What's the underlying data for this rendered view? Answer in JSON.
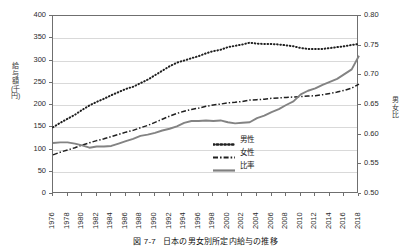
{
  "caption": {
    "number": "図 7-7",
    "text": "日本の男女別所定内給与の推移"
  },
  "axes": {
    "left_title": "給与額(千円)",
    "right_title": "男女比",
    "left_ticks": [
      "400",
      "350",
      "300",
      "250",
      "200",
      "150",
      "100",
      "50",
      "0"
    ],
    "right_ticks": [
      "0.80",
      "0.75",
      "0.70",
      "0.65",
      "0.60",
      "0.55",
      "0.50"
    ],
    "x_ticks": [
      "1976",
      "1978",
      "1980",
      "1982",
      "1984",
      "1986",
      "1988",
      "1990",
      "1992",
      "1994",
      "1996",
      "1998",
      "2000",
      "2002",
      "2004",
      "2006",
      "2008",
      "2010",
      "2012",
      "2014",
      "2016",
      "2018"
    ]
  },
  "legend": {
    "items": [
      {
        "label": "男性",
        "style": "dotted",
        "color": "#1f1f1f"
      },
      {
        "label": "女性",
        "style": "dashdot",
        "color": "#1f1f1f"
      },
      {
        "label": "比率",
        "style": "solid",
        "color": "#808080"
      }
    ]
  },
  "chart_data": {
    "type": "line",
    "title": "日本の男女別所定内給与の推移",
    "xlabel": "",
    "ylabel": "給与額(千円)",
    "y2label": "男女比",
    "ylim": [
      0,
      400
    ],
    "y2lim": [
      0.5,
      0.8
    ],
    "xlim": [
      1976,
      2018
    ],
    "grid": true,
    "legend_position": "center",
    "x": [
      1976,
      1977,
      1978,
      1979,
      1980,
      1981,
      1982,
      1983,
      1984,
      1985,
      1986,
      1987,
      1988,
      1989,
      1990,
      1991,
      1992,
      1993,
      1994,
      1995,
      1996,
      1997,
      1998,
      1999,
      2000,
      2001,
      2002,
      2003,
      2004,
      2005,
      2006,
      2007,
      2008,
      2009,
      2010,
      2011,
      2012,
      2013,
      2014,
      2015,
      2016,
      2017,
      2018
    ],
    "series": [
      {
        "name": "男性",
        "axis": "left",
        "unit": "千円",
        "values": [
          150,
          160,
          169,
          178,
          189,
          199,
          207,
          214,
          222,
          229,
          236,
          241,
          249,
          257,
          267,
          277,
          287,
          295,
          300,
          305,
          310,
          316,
          321,
          324,
          330,
          333,
          336,
          340,
          338,
          337,
          337,
          336,
          334,
          332,
          328,
          326,
          326,
          326,
          328,
          330,
          332,
          335,
          337
        ]
      },
      {
        "name": "女性",
        "axis": "left",
        "unit": "千円",
        "values": [
          88,
          94,
          99,
          104,
          110,
          115,
          120,
          124,
          129,
          134,
          139,
          143,
          149,
          154,
          161,
          168,
          175,
          181,
          186,
          190,
          193,
          197,
          200,
          202,
          205,
          206,
          208,
          211,
          212,
          213,
          215,
          216,
          217,
          218,
          219,
          220,
          221,
          223,
          226,
          229,
          233,
          238,
          247
        ]
      },
      {
        "name": "比率",
        "axis": "right",
        "unit": "",
        "values": [
          0.586,
          0.587,
          0.587,
          0.585,
          0.582,
          0.578,
          0.58,
          0.58,
          0.581,
          0.585,
          0.589,
          0.593,
          0.598,
          0.6,
          0.603,
          0.607,
          0.61,
          0.614,
          0.62,
          0.623,
          0.623,
          0.624,
          0.623,
          0.624,
          0.621,
          0.619,
          0.62,
          0.621,
          0.628,
          0.632,
          0.638,
          0.643,
          0.65,
          0.656,
          0.668,
          0.674,
          0.678,
          0.684,
          0.689,
          0.694,
          0.702,
          0.71,
          0.733
        ]
      }
    ]
  }
}
